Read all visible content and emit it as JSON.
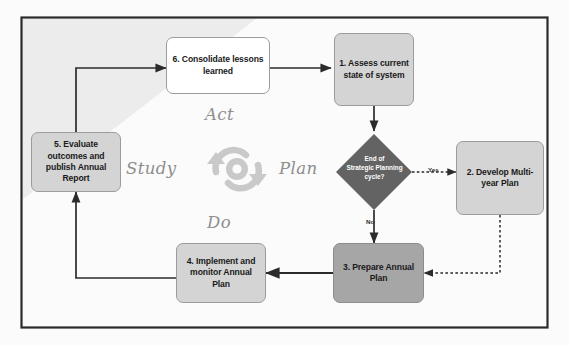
{
  "diagram": {
    "frame": {
      "border_color": "#2b2b2b",
      "background": "#fbfbfb"
    },
    "shaded_region": {
      "fill": "#ececec",
      "shape": "triangle-upper-left"
    },
    "colors": {
      "node_white": "#ffffff",
      "node_light_gray": "#d4d4d4",
      "node_mid_gray": "#a6a6a6",
      "decision_dark_gray": "#636363",
      "arrow": "#2b2b2b",
      "quadrant_label": "#8e8e8e",
      "cycle_icon": "#c9c9c9"
    },
    "nodes": [
      {
        "id": "n1",
        "label": "1. Assess current state of system",
        "fill": "light-gray"
      },
      {
        "id": "n2",
        "label": "2. Develop Multi-year Plan",
        "fill": "light-gray"
      },
      {
        "id": "n3",
        "label": "3. Prepare Annual Plan",
        "fill": "mid-gray"
      },
      {
        "id": "n4",
        "label": "4. Implement and monitor Annual Plan",
        "fill": "light-gray"
      },
      {
        "id": "n5",
        "label": "5. Evaluate outcomes and publish Annual Report",
        "fill": "light-gray"
      },
      {
        "id": "n6",
        "label": "6. Consolidate lessons learned",
        "fill": "white"
      }
    ],
    "decision": {
      "id": "d1",
      "line1": "End of",
      "line2": "Strategic Planning",
      "line3": "cycle?",
      "fill": "#636363"
    },
    "edge_labels": [
      {
        "id": "yes",
        "text": "Yes"
      },
      {
        "id": "no",
        "text": "No"
      }
    ],
    "quadrant_labels": [
      {
        "id": "act",
        "text": "Act"
      },
      {
        "id": "plan",
        "text": "Plan"
      },
      {
        "id": "study",
        "text": "Study"
      },
      {
        "id": "do",
        "text": "Do"
      }
    ],
    "center_icon": {
      "name": "cycle-arrows-icon"
    }
  }
}
